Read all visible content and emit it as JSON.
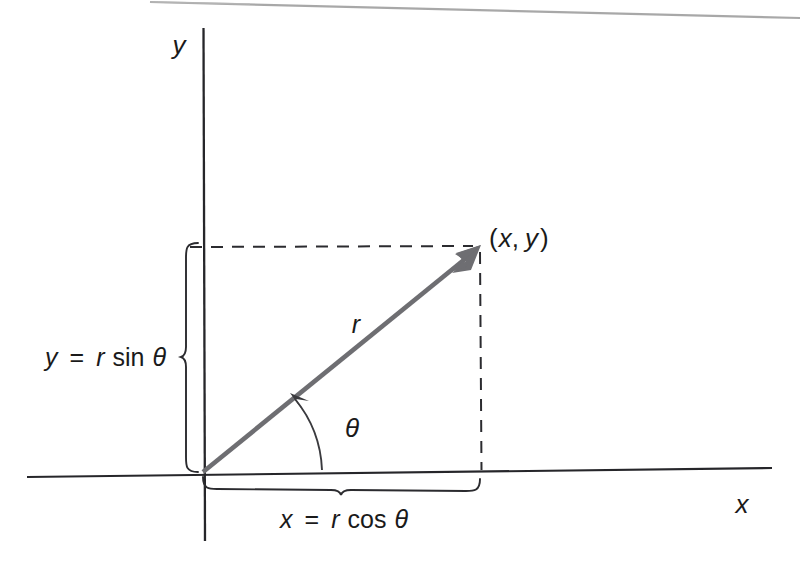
{
  "figure": {
    "type": "polar-coordinate-diagram",
    "background_color": "#ffffff",
    "ink_color": "#1a1a1a",
    "ray_color": "#6b6b6b",
    "axes": {
      "x_axis_label": "x",
      "y_axis_label": "y",
      "origin_label": "O",
      "x_axis": {
        "x1": 27,
        "y1": 477,
        "x2": 772,
        "y2": 468
      },
      "y_axis": {
        "x1": 203,
        "y1": 28,
        "x2": 205,
        "y2": 541
      }
    },
    "point": {
      "label_open": "(",
      "label_x": "x",
      "label_comma": ",",
      "label_y": "y",
      "label_close": ")",
      "label_full": "(x, y)",
      "px": 480,
      "py": 247
    },
    "ray": {
      "label": "r",
      "from_x": 203,
      "from_y": 472,
      "to_x": 480,
      "to_y": 247,
      "stroke_width": 4.5
    },
    "angle": {
      "label": "θ",
      "arc_radius": 118,
      "degrees": 39
    },
    "vertical_brace": {
      "equation_lhs": "y",
      "equation_eq": "=",
      "equation_r": "r",
      "equation_fn": "sin",
      "equation_theta": "θ",
      "equation_full": "y = r sin θ",
      "top_y": 243,
      "bottom_y": 472
    },
    "horizontal_brace": {
      "equation_lhs": "x",
      "equation_eq": "=",
      "equation_r": "r",
      "equation_fn": "cos",
      "equation_theta": "θ",
      "equation_full": "x = r cos θ",
      "left_x": 203,
      "right_x": 480
    },
    "dashed_lines": {
      "horizontal": {
        "x1": 190,
        "y1": 247,
        "x2": 478,
        "y2": 247
      },
      "vertical": {
        "x1": 480,
        "y1": 249,
        "x2": 481,
        "y2": 470
      },
      "dash_pattern": "11 9"
    },
    "scan_artifact": {
      "present": true,
      "description": "faint diagonal scan edge across top of page"
    }
  }
}
